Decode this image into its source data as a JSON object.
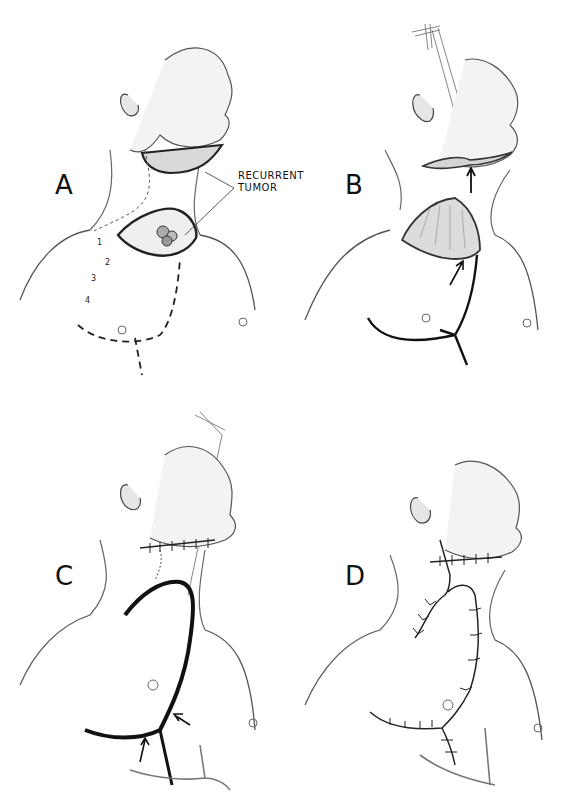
{
  "figure": {
    "panels": [
      {
        "id": "A",
        "label": "A",
        "annotations": {
          "callout_line1": "RECURRENT",
          "callout_line2": "TUMOR",
          "markers": [
            "1",
            "2",
            "3",
            "4"
          ]
        }
      },
      {
        "id": "B",
        "label": "B"
      },
      {
        "id": "C",
        "label": "C"
      },
      {
        "id": "D",
        "label": "D"
      }
    ]
  },
  "colors": {
    "ink": "#111111",
    "skin_shade": "#bfbfbf",
    "background": "#ffffff"
  }
}
